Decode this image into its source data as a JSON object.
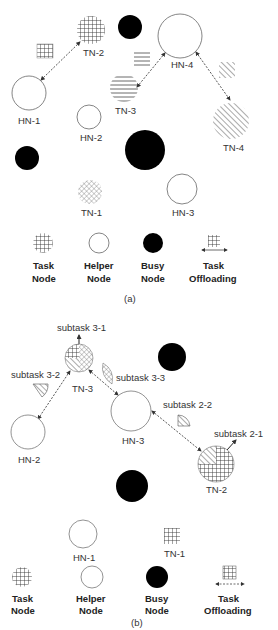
{
  "panel_a": {
    "caption": "(a)",
    "nodes": [
      {
        "id": "TN-2",
        "label": "TN-2",
        "type": "task",
        "pattern": "grid"
      },
      {
        "id": "HN-1",
        "label": "HN-1",
        "type": "helper"
      },
      {
        "id": "HN-2",
        "label": "HN-2",
        "type": "helper"
      },
      {
        "id": "HN-4",
        "label": "HN-4",
        "type": "helper"
      },
      {
        "id": "TN-3",
        "label": "TN-3",
        "type": "task",
        "pattern": "horizontal"
      },
      {
        "id": "TN-4",
        "label": "TN-4",
        "type": "task",
        "pattern": "diagonal"
      },
      {
        "id": "TN-1",
        "label": "TN-1",
        "type": "task",
        "pattern": "crosshatch"
      },
      {
        "id": "HN-3",
        "label": "HN-3",
        "type": "helper"
      }
    ],
    "offloads": [
      {
        "from": "TN-2",
        "to": "HN-1"
      },
      {
        "from": "TN-3",
        "to": "HN-4"
      },
      {
        "from": "TN-4",
        "to": "HN-4"
      }
    ],
    "legend": [
      {
        "line1": "Task",
        "line2": "Node",
        "icon": "task-node-icon"
      },
      {
        "line1": "Helper",
        "line2": "Node",
        "icon": "helper-node-icon"
      },
      {
        "line1": "Busy",
        "line2": "Node",
        "icon": "busy-node-icon"
      },
      {
        "line1": "Task",
        "line2": "Offloading",
        "icon": "task-offloading-icon"
      }
    ]
  },
  "panel_b": {
    "caption": "(b)",
    "nodes": [
      {
        "id": "TN-3",
        "label": "TN-3",
        "type": "task"
      },
      {
        "id": "HN-2",
        "label": "HN-2",
        "type": "helper"
      },
      {
        "id": "HN-3",
        "label": "HN-3",
        "type": "helper"
      },
      {
        "id": "TN-2",
        "label": "TN-2",
        "type": "task"
      },
      {
        "id": "HN-1",
        "label": "HN-1",
        "type": "helper"
      },
      {
        "id": "TN-1",
        "label": "TN-1",
        "type": "task"
      }
    ],
    "subtasks": {
      "s31": "subtask 3-1",
      "s32": "subtask 3-2",
      "s33": "subtask 3-3",
      "s22": "subtask 2-2",
      "s21": "subtask 2-1"
    },
    "legend": [
      {
        "line1": "Task",
        "line2": "Node",
        "icon": "task-node-icon"
      },
      {
        "line1": "Helper",
        "line2": "Node",
        "icon": "helper-node-icon"
      },
      {
        "line1": "Busy",
        "line2": "Node",
        "icon": "busy-node-icon"
      },
      {
        "line1": "Task",
        "line2": "Offloading",
        "icon": "task-offloading-icon"
      }
    ]
  },
  "colors": {
    "stroke": "#555555",
    "busy_fill": "#000000",
    "background": "#ffffff"
  }
}
